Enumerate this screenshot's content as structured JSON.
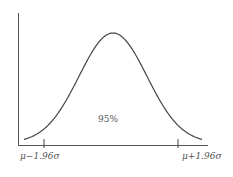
{
  "diagram": {
    "type": "normal-distribution",
    "center_label": "95%",
    "left_label": "μ−1.96σ",
    "right_label": "μ+1.96σ",
    "line_color": "#444444",
    "text_color": "#555555"
  },
  "chart_data": {
    "type": "line",
    "title": "",
    "xlabel": "",
    "ylabel": "",
    "annotations": [
      "95%",
      "μ−1.96σ",
      "μ+1.96σ"
    ],
    "x": [
      -3,
      -2.5,
      -1.96,
      -1.5,
      -1,
      -0.5,
      0,
      0.5,
      1,
      1.5,
      1.96,
      2.5,
      3
    ],
    "values": [
      0.004,
      0.018,
      0.058,
      0.13,
      0.242,
      0.352,
      0.399,
      0.352,
      0.242,
      0.13,
      0.058,
      0.018,
      0.004
    ],
    "grid": false,
    "legend": "none"
  }
}
